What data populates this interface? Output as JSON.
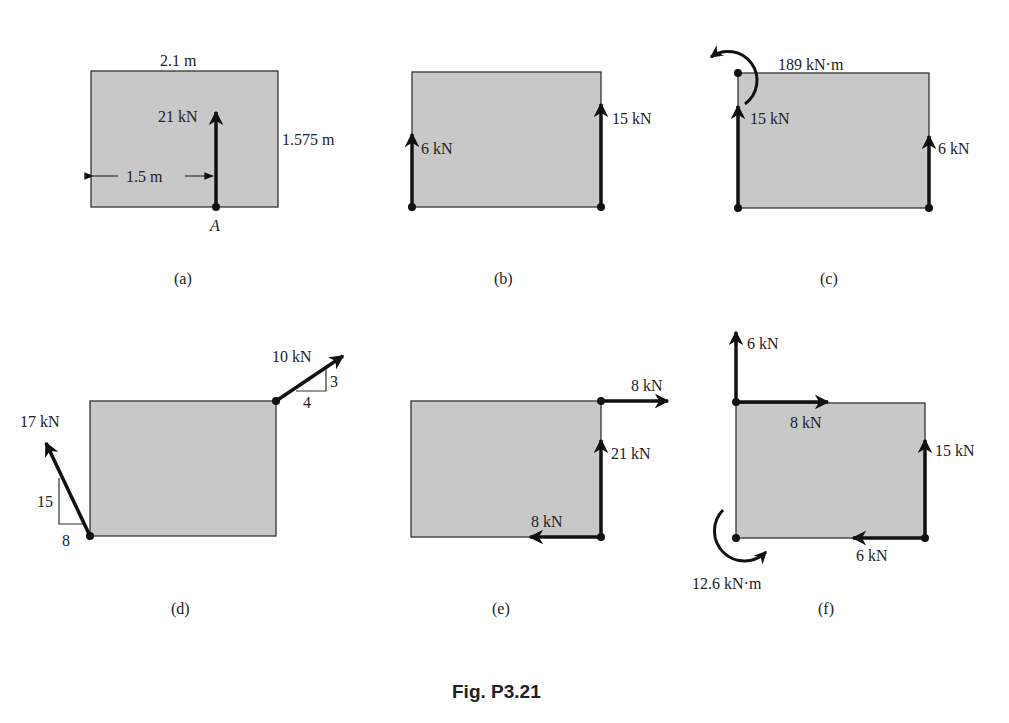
{
  "figure": {
    "caption": "Fig. P3.21",
    "accent_colors": {
      "plate_fill": "#c8c8c8",
      "line": "#111111",
      "background": "#ffffff"
    },
    "panels": [
      {
        "id": "a",
        "label": "(a)",
        "dimensions": {
          "width": "2.1 m",
          "height": "1.575 m",
          "offset": "1.5 m"
        },
        "point_label": "A",
        "forces": [
          {
            "label": "21 kN",
            "direction": "up",
            "location": "bottom edge, 1.5 m from left"
          }
        ]
      },
      {
        "id": "b",
        "label": "(b)",
        "forces": [
          {
            "label": "6 kN",
            "direction": "up",
            "location": "bottom-left corner"
          },
          {
            "label": "15 kN",
            "direction": "up",
            "location": "bottom-right corner"
          }
        ]
      },
      {
        "id": "c",
        "label": "(c)",
        "moments": [
          {
            "label": "189 kN·m",
            "direction": "counterclockwise",
            "location": "top-left corner"
          }
        ],
        "forces": [
          {
            "label": "15 kN",
            "direction": "up",
            "location": "bottom-left corner"
          },
          {
            "label": "6 kN",
            "direction": "up",
            "location": "bottom-right corner"
          }
        ]
      },
      {
        "id": "d",
        "label": "(d)",
        "forces": [
          {
            "label": "10 kN",
            "direction": "up-right",
            "slope": {
              "rise": "3",
              "run": "4"
            },
            "location": "top-right corner"
          },
          {
            "label": "17 kN",
            "direction": "up-left",
            "slope": {
              "rise": "15",
              "run": "8"
            },
            "location": "bottom-left corner"
          }
        ]
      },
      {
        "id": "e",
        "label": "(e)",
        "forces": [
          {
            "label": "8 kN",
            "direction": "right",
            "location": "top-right corner"
          },
          {
            "label": "21 kN",
            "direction": "up",
            "location": "bottom-right corner"
          },
          {
            "label": "8 kN",
            "direction": "left",
            "location": "bottom-right corner"
          }
        ]
      },
      {
        "id": "f",
        "label": "(f)",
        "forces": [
          {
            "label": "6 kN",
            "direction": "up",
            "location": "top-left corner"
          },
          {
            "label": "8 kN",
            "direction": "right",
            "location": "top-left corner"
          },
          {
            "label": "15 kN",
            "direction": "up",
            "location": "bottom-right corner"
          },
          {
            "label": "6 kN",
            "direction": "left",
            "location": "bottom-right corner"
          }
        ],
        "moments": [
          {
            "label": "12.6 kN·m",
            "direction": "counterclockwise",
            "location": "bottom-left corner"
          }
        ]
      }
    ]
  }
}
